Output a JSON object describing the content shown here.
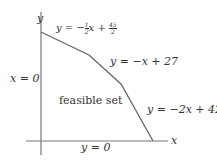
{
  "diagram": {
    "type": "feasible-region",
    "axes": {
      "x_label": "x",
      "y_label": "y"
    },
    "region_label": "feasible set",
    "boundary_labels": {
      "y_axis": "x = 0",
      "x_axis": "y = 0",
      "line1": {
        "lhs": "y = −",
        "frac1_num": "1",
        "frac1_den": "2",
        "mid": "x + ",
        "frac2_num": "45",
        "frac2_den": "2"
      },
      "line2": "y = −x + 27",
      "line3": "y = −2x + 42"
    },
    "colors": {
      "lines": "#666666",
      "text": "#333333",
      "background": "#ffffff"
    }
  }
}
